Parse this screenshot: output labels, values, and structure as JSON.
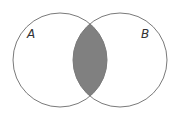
{
  "diagram": {
    "type": "venn",
    "sets": [
      {
        "label": "A",
        "cx": 60,
        "cy": 60,
        "r": 47
      },
      {
        "label": "B",
        "cx": 120,
        "cy": 60,
        "r": 47
      }
    ],
    "shaded_region": "A ∩ B",
    "colors": {
      "outline": "#7a7a7a",
      "fill": "#808080",
      "background": "#ffffff"
    }
  }
}
